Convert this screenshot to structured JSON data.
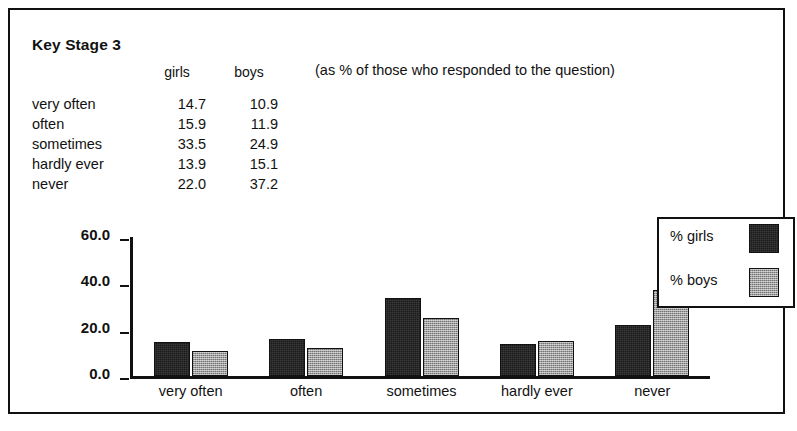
{
  "title": "Key Stage 3",
  "note": "(as % of those who responded to the question)",
  "table": {
    "headers": {
      "label": "",
      "girls": "girls",
      "boys": "boys"
    },
    "rows": [
      {
        "label": "very often",
        "girls": "14.7",
        "boys": "10.9"
      },
      {
        "label": "often",
        "girls": "15.9",
        "boys": "11.9"
      },
      {
        "label": "sometimes",
        "girls": "33.5",
        "boys": "24.9"
      },
      {
        "label": "hardly ever",
        "girls": "13.9",
        "boys": "15.1"
      },
      {
        "label": "never",
        "girls": "22.0",
        "boys": "37.2"
      }
    ]
  },
  "legend": {
    "items": [
      {
        "label": "% girls",
        "color": "#1a1a1a"
      },
      {
        "label": "% boys",
        "color": "#9e9e9e"
      }
    ]
  },
  "chart_data": {
    "type": "bar",
    "title": "Key Stage 3",
    "xlabel": "",
    "ylabel": "",
    "categories": [
      "very often",
      "often",
      "sometimes",
      "hardly ever",
      "never"
    ],
    "series": [
      {
        "name": "% girls",
        "values": [
          14.7,
          15.9,
          33.5,
          13.9,
          22.0
        ],
        "color": "#1a1a1a"
      },
      {
        "name": "% boys",
        "values": [
          10.9,
          11.9,
          24.9,
          15.1,
          37.2
        ],
        "color": "#9e9e9e"
      }
    ],
    "ylim": [
      0.0,
      60.0
    ],
    "yticks": [
      "0.0",
      "20.0",
      "40.0",
      "60.0"
    ],
    "ytick_values": [
      0.0,
      20.0,
      40.0,
      60.0
    ],
    "grid": false,
    "legend_position": "right"
  }
}
